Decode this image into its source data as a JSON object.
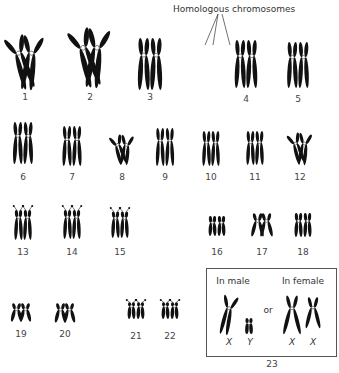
{
  "figure": {
    "title": "Homologous chromosomes",
    "title_pos": [
      234,
      10
    ],
    "pointer_lines": [
      [
        218,
        14,
        205,
        45
      ],
      [
        218,
        14,
        213,
        45
      ],
      [
        222,
        14,
        230,
        45
      ]
    ],
    "colors": {
      "chromosome": "#111111",
      "centromere": "#ffffff",
      "label": "#444444",
      "box_border": "#555555"
    }
  },
  "pairs": [
    {
      "label": "1",
      "x": 25,
      "y_top": 35,
      "height": 55,
      "label_y": 98,
      "style": "bent"
    },
    {
      "label": "2",
      "x": 90,
      "y_top": 28,
      "height": 60,
      "label_y": 98,
      "style": "bent"
    },
    {
      "label": "3",
      "x": 150,
      "y_top": 38,
      "height": 52,
      "label_y": 98,
      "style": "straight"
    },
    {
      "label": "4",
      "x": 246,
      "y_top": 40,
      "height": 48,
      "label_y": 100,
      "style": "straight"
    },
    {
      "label": "5",
      "x": 298,
      "y_top": 42,
      "height": 46,
      "label_y": 100,
      "style": "straight"
    },
    {
      "label": "6",
      "x": 23,
      "y_top": 122,
      "height": 42,
      "label_y": 178,
      "style": "straight"
    },
    {
      "label": "7",
      "x": 72,
      "y_top": 126,
      "height": 40,
      "label_y": 178,
      "style": "straight"
    },
    {
      "label": "8",
      "x": 122,
      "y_top": 135,
      "height": 30,
      "label_y": 178,
      "style": "bent"
    },
    {
      "label": "9",
      "x": 165,
      "y_top": 128,
      "height": 38,
      "label_y": 178,
      "style": "straight"
    },
    {
      "label": "10",
      "x": 211,
      "y_top": 131,
      "height": 35,
      "label_y": 178,
      "style": "straight"
    },
    {
      "label": "11",
      "x": 255,
      "y_top": 131,
      "height": 34,
      "label_y": 178,
      "style": "straight"
    },
    {
      "label": "12",
      "x": 300,
      "y_top": 133,
      "height": 32,
      "label_y": 178,
      "style": "bent"
    },
    {
      "label": "13",
      "x": 23,
      "y_top": 206,
      "height": 34,
      "label_y": 253,
      "style": "satellite"
    },
    {
      "label": "14",
      "x": 72,
      "y_top": 206,
      "height": 33,
      "label_y": 253,
      "style": "satellite"
    },
    {
      "label": "15",
      "x": 120,
      "y_top": 208,
      "height": 30,
      "label_y": 253,
      "style": "satellite"
    },
    {
      "label": "16",
      "x": 217,
      "y_top": 216,
      "height": 20,
      "label_y": 253,
      "style": "straight"
    },
    {
      "label": "17",
      "x": 262,
      "y_top": 213,
      "height": 24,
      "label_y": 253,
      "style": "x"
    },
    {
      "label": "18",
      "x": 303,
      "y_top": 213,
      "height": 24,
      "label_y": 253,
      "style": "straight"
    },
    {
      "label": "19",
      "x": 21,
      "y_top": 303,
      "height": 19,
      "label_y": 335,
      "style": "x"
    },
    {
      "label": "20",
      "x": 65,
      "y_top": 303,
      "height": 20,
      "label_y": 335,
      "style": "x"
    },
    {
      "label": "21",
      "x": 136,
      "y_top": 300,
      "height": 19,
      "label_y": 337,
      "style": "satellite"
    },
    {
      "label": "22",
      "x": 170,
      "y_top": 300,
      "height": 19,
      "label_y": 337,
      "style": "satellite"
    }
  ],
  "sex_chromosomes": {
    "label": "23",
    "label_pos": [
      272,
      364
    ],
    "box": {
      "x": 206,
      "y": 268,
      "w": 129,
      "h": 87
    },
    "male": {
      "heading": "In male",
      "heading_pos": [
        233,
        282
      ],
      "letters": [
        "X",
        "Y"
      ],
      "letter_pos": [
        [
          229,
          342
        ],
        [
          249,
          342
        ]
      ]
    },
    "female": {
      "heading": "In female",
      "heading_pos": [
        303,
        282
      ],
      "letters": [
        "X",
        "X"
      ],
      "letter_pos": [
        [
          292,
          342
        ],
        [
          313,
          342
        ]
      ]
    },
    "connector": "or",
    "connector_pos": [
      272,
      312
    ]
  }
}
